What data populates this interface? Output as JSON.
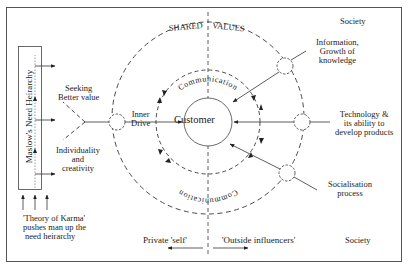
{
  "labels": {
    "society_top": "Society",
    "society_bottom": "Society",
    "shared_values": "SHARED VALUES",
    "shared_values_left": "SHARED",
    "shared_values_right": "VALUES",
    "communication_top": "Communication",
    "communication_bottom": "Communication",
    "customer": "Customer",
    "inner_drive_line1": "Inner",
    "inner_drive_line2": "Drive",
    "seeking_line1": "Seeking",
    "seeking_line2": "Better value",
    "individuality_line1": "Individuality",
    "individuality_line2": "and",
    "individuality_line3": "creativity",
    "maslow": "Maslow's Need Heirarchy",
    "karma_line1": "'Theory of Karma'",
    "karma_line2": "pushes man up the",
    "karma_line3": "need heirarchy",
    "information_line1": "Information,",
    "information_line2": "Growth of",
    "information_line3": "knowledge",
    "technology_line1": "Technology &",
    "technology_line2": "its ability to",
    "technology_line3": "develop products",
    "socialisation_line1": "Socialisation",
    "socialisation_line2": "process",
    "private_self": "Private 'self'",
    "outside_influencers": "'Outside influencers'"
  },
  "colors": {
    "line": "#333333",
    "text": "#222222",
    "frame": "#555555",
    "background": "#ffffff"
  }
}
